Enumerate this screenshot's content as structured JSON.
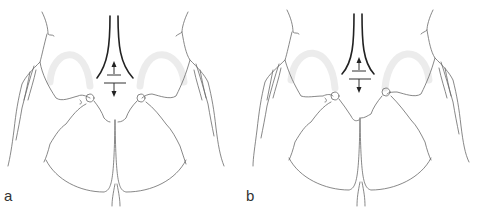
{
  "figure": {
    "type": "anatomical line illustration",
    "panels": [
      {
        "id": "a",
        "label": "a"
      },
      {
        "id": "b",
        "label": "b"
      }
    ],
    "colors": {
      "line": "#6a6a6a",
      "bold_line": "#222222",
      "highlight_arc": "#ececec",
      "background": "#ffffff"
    },
    "icons": [
      "up-arrow-icon",
      "down-arrow-icon"
    ]
  }
}
